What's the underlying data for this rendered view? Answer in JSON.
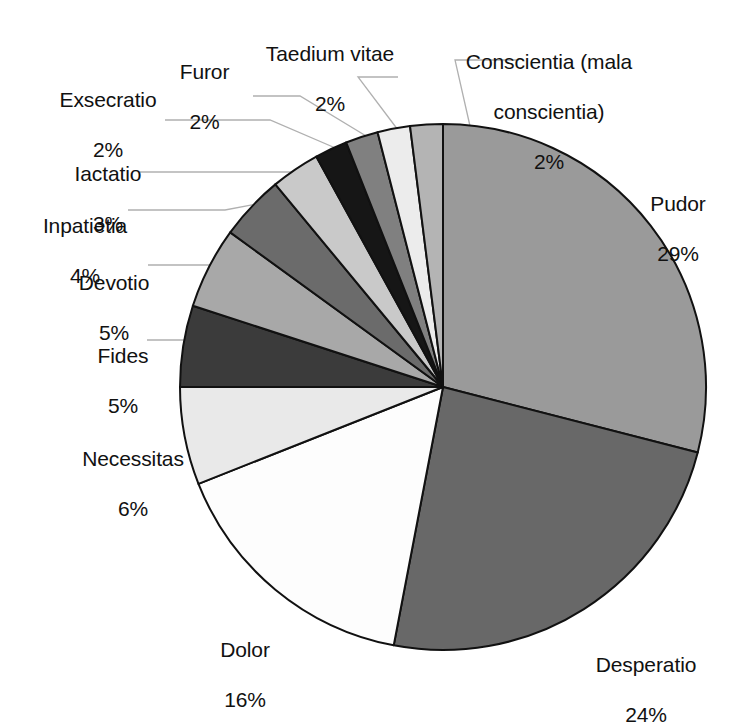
{
  "chart_data": {
    "type": "pie",
    "title": "",
    "subtitle": "",
    "xlabel": "",
    "ylabel": "",
    "legend_position": "none",
    "grid": false,
    "total_label": "100%",
    "start_angle_deg": 0,
    "direction": "clockwise",
    "categories": [
      "Pudor",
      "Desperatio",
      "Dolor",
      "Necessitas",
      "Fides",
      "Devotio",
      "Inpatietia",
      "Iactatio",
      "Exsecratio",
      "Furor",
      "Taedium vitae",
      "Conscientia (mala conscientia)"
    ],
    "values": [
      29,
      24,
      16,
      6,
      5,
      5,
      4,
      3,
      2,
      2,
      2,
      2
    ],
    "value_labels": [
      "29%",
      "24%",
      "16%",
      "6%",
      "5%",
      "5%",
      "4%",
      "3%",
      "2%",
      "2%",
      "2%",
      "2%"
    ],
    "slice_colors": [
      "#9a9a9a",
      "#686868",
      "#fdfdfd",
      "#e9e9e9",
      "#3b3b3b",
      "#a8a8a8",
      "#6b6b6b",
      "#c9c9c9",
      "#161616",
      "#808080",
      "#ececec",
      "#b4b4b4"
    ],
    "slice_outline_color": "#111111",
    "leader_line_color": "#b0b0b0",
    "background_color": "#ffffff",
    "text_color": "#111111"
  },
  "labels": [
    {
      "name": "Taedium vitae",
      "pct": "2%"
    },
    {
      "name": "Furor",
      "pct": "2%"
    },
    {
      "name": "Conscientia (mala",
      "pct_line2": "conscientia)",
      "pct": "2%"
    },
    {
      "name": "Exsecratio",
      "pct": "2%"
    },
    {
      "name": "Iactatio",
      "pct": "3%"
    },
    {
      "name": "Inpatietia",
      "pct": "4%"
    },
    {
      "name": "Devotio",
      "pct": "5%"
    },
    {
      "name": "Fides",
      "pct": "5%"
    },
    {
      "name": "Necessitas",
      "pct": "6%"
    },
    {
      "name": "Dolor",
      "pct": "16%"
    },
    {
      "name": "Desperatio",
      "pct": "24%"
    },
    {
      "name": "Pudor",
      "pct": "29%"
    }
  ],
  "geometry": {
    "center_x": 443,
    "center_y": 387,
    "radius": 263
  }
}
